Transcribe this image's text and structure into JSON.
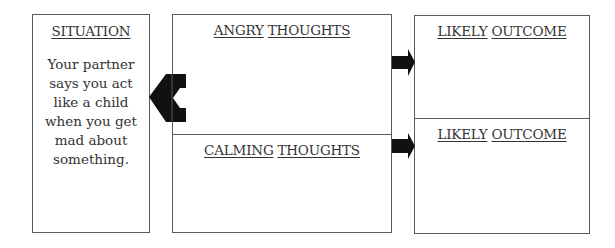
{
  "situation": {
    "title": "SITUATION",
    "text": "Your partner says you act like a child when you get mad about something."
  },
  "thoughts": {
    "angry": {
      "word1": "ANGRY",
      "word2": "THOUGHTS"
    },
    "calming": {
      "word1": "CALMING",
      "word2": "THOUGHTS"
    }
  },
  "outcomes": {
    "top": {
      "word1": "LIKELY",
      "word2": "OUTCOME"
    },
    "bottom": {
      "word1": "LIKELY",
      "word2": "OUTCOME"
    }
  },
  "colors": {
    "border": "#5a5a5a",
    "arrow": "#111111",
    "text": "#333333"
  }
}
